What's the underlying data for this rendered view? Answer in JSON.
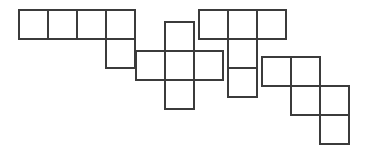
{
  "figure": {
    "canvas": {
      "width": 366,
      "height": 150,
      "background": "#ffffff"
    },
    "style": {
      "cell_size": 29,
      "stroke_color": "#3b3b3b",
      "stroke_width": 2.2,
      "fill_color": "#ffffff"
    },
    "shapes": [
      {
        "id": "shape-1",
        "name": "L-pentomino",
        "label": "",
        "origin": {
          "x": 19,
          "y": 10
        },
        "cells": [
          {
            "col": 0,
            "row": 0
          },
          {
            "col": 1,
            "row": 0
          },
          {
            "col": 2,
            "row": 0
          },
          {
            "col": 3,
            "row": 0
          },
          {
            "col": 3,
            "row": 1
          }
        ]
      },
      {
        "id": "shape-2",
        "name": "X-pentomino-plus",
        "label": "",
        "origin": {
          "x": 136,
          "y": 22
        },
        "cells": [
          {
            "col": 1,
            "row": 0
          },
          {
            "col": 0,
            "row": 1
          },
          {
            "col": 1,
            "row": 1
          },
          {
            "col": 2,
            "row": 1
          },
          {
            "col": 1,
            "row": 2
          }
        ]
      },
      {
        "id": "shape-3",
        "name": "T-pentomino",
        "label": "",
        "origin": {
          "x": 199,
          "y": 10
        },
        "cells": [
          {
            "col": 0,
            "row": 0
          },
          {
            "col": 1,
            "row": 0
          },
          {
            "col": 2,
            "row": 0
          },
          {
            "col": 1,
            "row": 1
          },
          {
            "col": 1,
            "row": 2
          }
        ]
      },
      {
        "id": "shape-4",
        "name": "W-pentomino-staircase",
        "label": "",
        "origin": {
          "x": 262,
          "y": 57
        },
        "cells": [
          {
            "col": 0,
            "row": 0
          },
          {
            "col": 1,
            "row": 0
          },
          {
            "col": 1,
            "row": 1
          },
          {
            "col": 2,
            "row": 1
          },
          {
            "col": 2,
            "row": 2
          }
        ]
      }
    ]
  }
}
